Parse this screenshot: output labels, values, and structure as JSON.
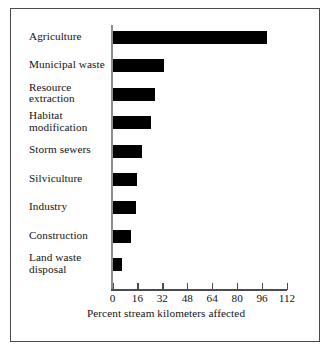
{
  "chart_data": {
    "type": "bar",
    "orientation": "horizontal",
    "title": "",
    "xlabel": "Percent stream kilometers affected",
    "ylabel": "",
    "xlim": [
      0,
      112
    ],
    "xticks": [
      0,
      16,
      32,
      48,
      64,
      80,
      96,
      112
    ],
    "grid": false,
    "legend": null,
    "bar_color": "#000000",
    "categories": [
      "Agriculture",
      "Municipal waste",
      "Resource extraction",
      "Habitat modification",
      "Storm sewers",
      "Silviculture",
      "Industry",
      "Construction",
      "Land waste disposal"
    ],
    "category_lines": [
      [
        "Agriculture"
      ],
      [
        "Municipal waste"
      ],
      [
        "Resource",
        "extraction"
      ],
      [
        "Habitat",
        "modification"
      ],
      [
        "Storm sewers"
      ],
      [
        "Silviculture"
      ],
      [
        "Industry"
      ],
      [
        "Construction"
      ],
      [
        "Land waste",
        "disposal"
      ]
    ],
    "values": [
      99,
      33,
      27,
      25,
      19,
      16,
      15,
      12,
      6
    ]
  }
}
